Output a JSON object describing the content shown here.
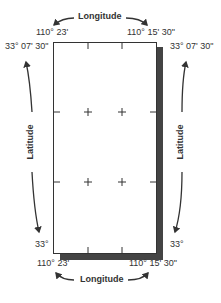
{
  "diagram": {
    "top_label": "Longitude",
    "bottom_label": "Longitude",
    "left_label": "Latitude",
    "right_label": "Latitude",
    "coords": {
      "top_left_lon": "110° 23'",
      "top_right_lon": "110° 15' 30\"",
      "bottom_left_lon": "110° 23'",
      "bottom_right_lon": "110° 15' 30\"",
      "left_top_lat": "33° 07' 30\"",
      "right_top_lat": "33° 07' 30\"",
      "left_bottom_lat": "33°",
      "right_bottom_lat": "33°"
    },
    "colors": {
      "frame": "#333333",
      "shadow": "#444444",
      "text": "#333333"
    }
  }
}
